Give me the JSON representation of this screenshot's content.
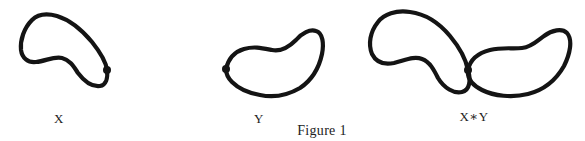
{
  "figure": {
    "caption": "Figure 1",
    "panels": [
      {
        "id": "X",
        "label": "X",
        "description": "closed loop with basepoint on right side"
      },
      {
        "id": "Y",
        "label": "Y",
        "description": "closed loop with basepoint on left side"
      },
      {
        "id": "XY",
        "label": "X∗Y",
        "description": "wedge of X and Y joined at the shared basepoint"
      }
    ]
  },
  "colors": {
    "stroke": "#141414",
    "background": "#ffffff",
    "text": "#222222"
  }
}
